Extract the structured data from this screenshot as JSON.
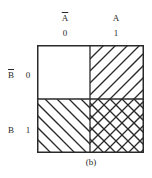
{
  "columns": [
    {
      "variable": "A",
      "complemented": true,
      "value": "0"
    },
    {
      "variable": "A",
      "complemented": false,
      "value": "1"
    }
  ],
  "rows": [
    {
      "variable": "B",
      "complemented": true,
      "value": "0"
    },
    {
      "variable": "B",
      "complemented": false,
      "value": "1"
    }
  ],
  "cells": [
    {
      "row": 0,
      "col": 0,
      "pattern": "none"
    },
    {
      "row": 0,
      "col": 1,
      "pattern": "forward-hatch"
    },
    {
      "row": 1,
      "col": 0,
      "pattern": "back-hatch"
    },
    {
      "row": 1,
      "col": 1,
      "pattern": "cross-hatch"
    }
  ],
  "caption": "(b)",
  "colors": {
    "line": "#2a2a2a",
    "background": "#ffffff"
  }
}
